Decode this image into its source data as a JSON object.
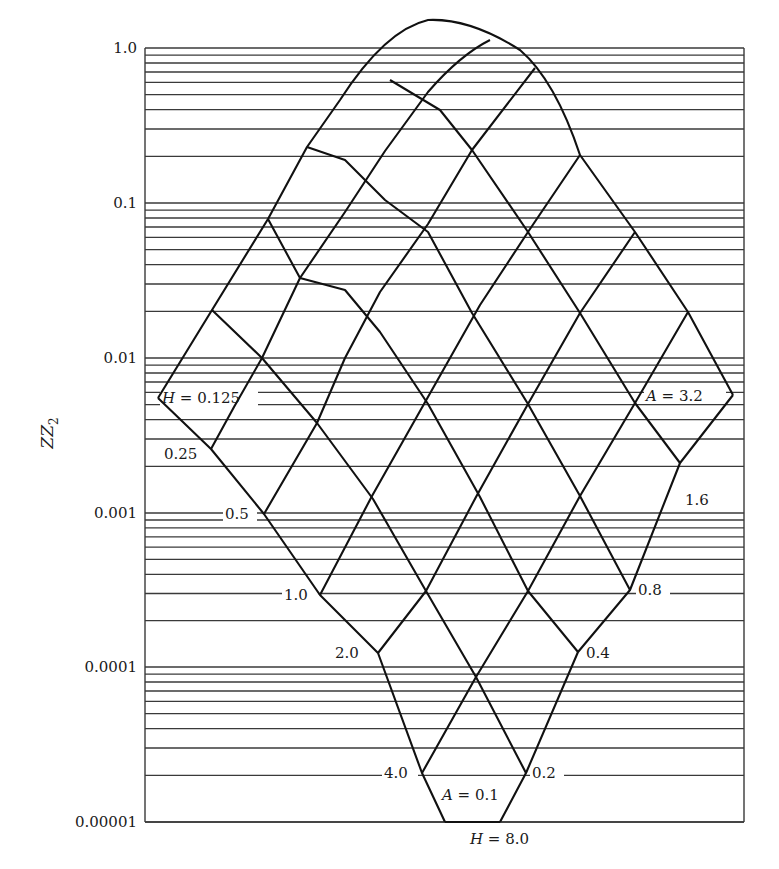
{
  "chart_data": {
    "type": "line",
    "title": "",
    "xlabel": "",
    "ylabel": "ZZ2",
    "yscale": "log",
    "ylim": [
      1e-05,
      1.0
    ],
    "ytick_labels": [
      "1.0",
      "0.1",
      "0.01",
      "0.001",
      "0.0001",
      "0.00001"
    ],
    "ytick_values": [
      1.0,
      0.1,
      0.01,
      0.001,
      0.0001,
      1e-05
    ],
    "grid": "horizontal log minor gridlines (2..9 per decade)",
    "families": {
      "H": {
        "label_prefix": "H",
        "values": [
          0.125,
          0.25,
          0.5,
          1.0,
          2.0,
          4.0,
          8.0
        ],
        "labels": [
          "H = 0.125",
          "0.25",
          "0.5",
          "1.0",
          "2.0",
          "4.0",
          "H = 8.0"
        ]
      },
      "A": {
        "label_prefix": "A",
        "values": [
          0.1,
          0.2,
          0.4,
          0.8,
          1.6,
          3.2
        ],
        "labels": [
          "A = 0.1",
          "0.2",
          "0.4",
          "0.8",
          "1.6",
          "A = 3.2"
        ]
      }
    },
    "approx_ZZ2_at_left_edge_nodes": {
      "H=0.125": 0.006,
      "H=0.25": 0.0028,
      "H=0.5": 0.001,
      "H=1.0": 0.0003,
      "H=2.0": 0.00012,
      "H=4.0": 2e-05
    },
    "approx_ZZ2_at_right_edge_nodes": {
      "A=3.2": 0.006,
      "A=1.6": 0.0016,
      "A=0.8": 0.0003,
      "A=0.4": 0.00012,
      "A=0.2": 2e-05
    },
    "peak_ZZ2": 1.0
  },
  "axis": {
    "ylabel_main": "ZZ",
    "ylabel_sub": "2",
    "ticks": [
      {
        "label": "1.0",
        "y": 48
      },
      {
        "label": "0.1",
        "y": 203
      },
      {
        "label": "0.01",
        "y": 358
      },
      {
        "label": "0.001",
        "y": 513
      },
      {
        "label": "0.0001",
        "y": 667
      },
      {
        "label": "0.00001",
        "y": 822
      }
    ]
  },
  "labels": {
    "h_0125_var": "H",
    "h_0125_val": " = 0.125",
    "h_025": "0.25",
    "h_05": "0.5",
    "h_10": "1.0",
    "h_20": "2.0",
    "h_40": "4.0",
    "h_80_var": "H",
    "h_80_val": " = 8.0",
    "a_01_var": "A",
    "a_01_val": " = 0.1",
    "a_02": "0.2",
    "a_04": "0.4",
    "a_08": "0.8",
    "a_16": "1.6",
    "a_32_var": "A",
    "a_32_val": " = 3.2"
  },
  "colors": {
    "ink": "#111111",
    "grid": "#3a3a3a",
    "background": "#ffffff"
  }
}
